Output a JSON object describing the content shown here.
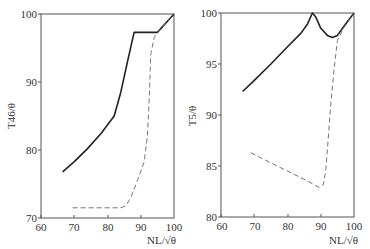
{
  "chart_data": [
    {
      "type": "line",
      "title": "",
      "xlabel": "NL/√θ",
      "ylabel": "T46/θ",
      "xlim": [
        60,
        100
      ],
      "ylim": [
        70,
        100
      ],
      "xticks": [
        "60",
        "70",
        "80",
        "90",
        "100"
      ],
      "yticks": [
        "70",
        "80",
        "90",
        "100"
      ],
      "grid": false,
      "legend": null,
      "series": [
        {
          "name": "solid",
          "style": "solid",
          "points": [
            [
              66.5,
              76.8
            ],
            [
              70,
              78.3
            ],
            [
              74,
              80.2
            ],
            [
              78,
              82.4
            ],
            [
              82,
              85.0
            ],
            [
              84,
              88.5
            ],
            [
              86,
              93.0
            ],
            [
              88,
              97.3
            ],
            [
              95,
              97.3
            ],
            [
              100,
              100
            ]
          ]
        },
        {
          "name": "dashed",
          "style": "dashed",
          "points": [
            [
              69.5,
              71.5
            ],
            [
              84,
              71.5
            ],
            [
              85.5,
              71.8
            ],
            [
              87,
              73.0
            ],
            [
              89,
              75.5
            ],
            [
              91,
              78.2
            ],
            [
              92,
              82.0
            ],
            [
              92.6,
              88.0
            ],
            [
              93.0,
              94.0
            ],
            [
              94,
              96.5
            ],
            [
              95,
              97.3
            ],
            [
              100,
              100
            ]
          ]
        }
      ]
    },
    {
      "type": "line",
      "title": "",
      "xlabel": "NL/√θ",
      "ylabel": "T5/θ",
      "xlim": [
        60,
        100
      ],
      "ylim": [
        80,
        100
      ],
      "xticks": [
        "60",
        "70",
        "80",
        "90",
        "100"
      ],
      "yticks": [
        "80",
        "85",
        "90",
        "95",
        "100"
      ],
      "grid": false,
      "legend": null,
      "series": [
        {
          "name": "solid",
          "style": "solid",
          "points": [
            [
              66.5,
              92.3
            ],
            [
              70,
              93.4
            ],
            [
              75,
              95.0
            ],
            [
              80,
              96.7
            ],
            [
              84,
              98.0
            ],
            [
              86,
              98.9
            ],
            [
              87.5,
              100
            ],
            [
              88.5,
              99.6
            ],
            [
              90,
              98.5
            ],
            [
              92,
              97.8
            ],
            [
              93.5,
              97.6
            ],
            [
              95,
              97.8
            ],
            [
              97,
              98.7
            ],
            [
              100,
              100
            ]
          ]
        },
        {
          "name": "dashed",
          "style": "dashed",
          "points": [
            [
              69,
              86.3
            ],
            [
              75,
              85.3
            ],
            [
              80,
              84.5
            ],
            [
              85,
              83.7
            ],
            [
              89.5,
              82.9
            ],
            [
              90.8,
              83.2
            ],
            [
              91.5,
              84.5
            ],
            [
              92.2,
              87.5
            ],
            [
              93,
              91.0
            ],
            [
              94,
              94.5
            ],
            [
              95,
              97.3
            ],
            [
              97,
              98.6
            ],
            [
              100,
              100
            ]
          ]
        }
      ]
    }
  ],
  "left_chart": {
    "ylabel": "T46/θ",
    "xlabel": "NL/√θ",
    "xticks": [
      "60",
      "70",
      "80",
      "90",
      "100"
    ],
    "yticks": [
      "70",
      "80",
      "90",
      "100"
    ]
  },
  "right_chart": {
    "ylabel": "T5/θ",
    "xlabel": "NL/√θ",
    "xticks": [
      "60",
      "70",
      "80",
      "90",
      "100"
    ],
    "yticks": [
      "80",
      "85",
      "90",
      "95",
      "100"
    ]
  }
}
